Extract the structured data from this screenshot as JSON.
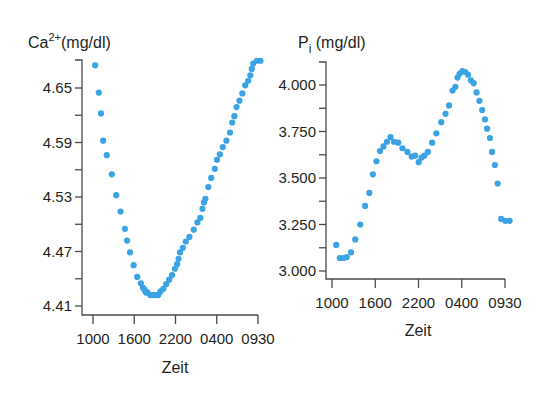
{
  "colors": {
    "dot": "#3aa3e3",
    "axis": "#4a4a4a",
    "text": "#231f20"
  },
  "chart_data": [
    {
      "type": "scatter",
      "title": "Ca2+(mg/dl)",
      "ylabel_main": "Ca",
      "ylabel_sup": "2+",
      "ylabel_unit": "(mg/dl)",
      "xlabel": "Zeit",
      "x_tick_labels": [
        "1000",
        "1600",
        "2200",
        "0400",
        "0930"
      ],
      "y_tick_labels": [
        "4.65",
        "4.59",
        "4.53",
        "4.47",
        "4.41"
      ],
      "y_ticks": [
        4.65,
        4.59,
        4.53,
        4.47,
        4.41
      ],
      "ylim": [
        4.41,
        4.68
      ],
      "grid": false,
      "series": [
        {
          "name": "Ca2+",
          "x": [
            0.15,
            0.4,
            0.55,
            0.7,
            0.95,
            1.3,
            1.6,
            1.9,
            2.2,
            2.35,
            2.55,
            2.8,
            3.05,
            3.3,
            3.45,
            3.55,
            3.65,
            3.75,
            3.95,
            4.1,
            4.25,
            4.4,
            4.5,
            4.65,
            4.85,
            5.05,
            5.25,
            5.45,
            5.65,
            5.8,
            5.9,
            6.0,
            6.2,
            6.4,
            6.65,
            6.95,
            7.2,
            7.4,
            7.55,
            7.65,
            7.75,
            7.95,
            8.15,
            8.4,
            8.55,
            8.75,
            8.95,
            9.2,
            9.45,
            9.6,
            9.75,
            9.9,
            10.1,
            10.3,
            10.5,
            10.7,
            10.85,
            10.95,
            11.05,
            11.3,
            11.55
          ],
          "y": [
            4.675,
            4.645,
            4.622,
            4.592,
            4.576,
            4.555,
            4.532,
            4.514,
            4.495,
            4.482,
            4.469,
            4.455,
            4.442,
            4.435,
            4.43,
            4.428,
            4.425,
            4.425,
            4.422,
            4.422,
            4.422,
            4.422,
            4.422,
            4.426,
            4.429,
            4.434,
            4.439,
            4.444,
            4.451,
            4.456,
            4.462,
            4.469,
            4.474,
            4.481,
            4.486,
            4.494,
            4.502,
            4.507,
            4.517,
            4.524,
            4.528,
            4.541,
            4.551,
            4.561,
            4.571,
            4.577,
            4.585,
            4.592,
            4.601,
            4.612,
            4.619,
            4.629,
            4.636,
            4.644,
            4.653,
            4.658,
            4.664,
            4.671,
            4.677,
            4.68,
            4.68
          ]
        }
      ]
    },
    {
      "type": "scatter",
      "title": "Pi (mg/dl)",
      "ylabel_main": "P",
      "ylabel_sub": "i",
      "ylabel_unit": " (mg/dl)",
      "xlabel": "Zeit",
      "x_tick_labels": [
        "1000",
        "1600",
        "2200",
        "0400",
        "0930"
      ],
      "y_tick_labels": [
        "4.000",
        "3.750",
        "3.500",
        "3.250",
        "3.000"
      ],
      "y_ticks": [
        4.0,
        3.75,
        3.5,
        3.25,
        3.0
      ],
      "ylim": [
        3.0,
        4.125
      ],
      "grid": false,
      "series": [
        {
          "name": "Pi",
          "x": [
            0.3,
            0.55,
            0.8,
            1.05,
            1.35,
            1.65,
            2.0,
            2.35,
            2.65,
            2.9,
            3.15,
            3.4,
            3.65,
            3.9,
            4.15,
            4.4,
            4.7,
            5.0,
            5.35,
            5.65,
            5.9,
            6.15,
            6.35,
            6.55,
            6.8,
            7.1,
            7.4,
            7.75,
            8.05,
            8.3,
            8.55,
            8.75,
            8.9,
            9.05,
            9.25,
            9.45,
            9.65,
            9.85,
            10.05,
            10.25,
            10.45,
            10.65,
            10.85,
            11.0,
            11.2,
            11.35,
            11.55,
            11.75,
            12.0,
            12.3,
            12.6
          ],
          "y": [
            3.14,
            3.07,
            3.07,
            3.075,
            3.1,
            3.17,
            3.25,
            3.35,
            3.42,
            3.52,
            3.59,
            3.645,
            3.67,
            3.695,
            3.72,
            3.695,
            3.69,
            3.66,
            3.64,
            3.615,
            3.62,
            3.585,
            3.61,
            3.62,
            3.64,
            3.69,
            3.74,
            3.8,
            3.845,
            3.89,
            3.97,
            3.99,
            4.04,
            4.06,
            4.075,
            4.07,
            4.055,
            4.025,
            4.01,
            3.96,
            3.915,
            3.865,
            3.815,
            3.765,
            3.715,
            3.64,
            3.57,
            3.47,
            3.28,
            3.27,
            3.27
          ]
        }
      ]
    }
  ]
}
